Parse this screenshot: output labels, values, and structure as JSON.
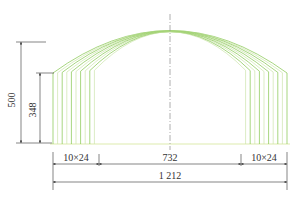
{
  "diagram": {
    "type": "greenhouse-arch-cross-section",
    "colors": {
      "arch_stroke": "#7cc242",
      "column_stroke": "#c9e3a8",
      "ground": "#e8f2c8",
      "dimension": "#333333",
      "centerline": "#999999"
    },
    "arch_count": 10,
    "dimensions": {
      "total_height": "500",
      "shoulder_height": "348",
      "left_bay": "10×24",
      "center_span": "732",
      "right_bay": "10×24",
      "total_width": "1 212"
    }
  }
}
